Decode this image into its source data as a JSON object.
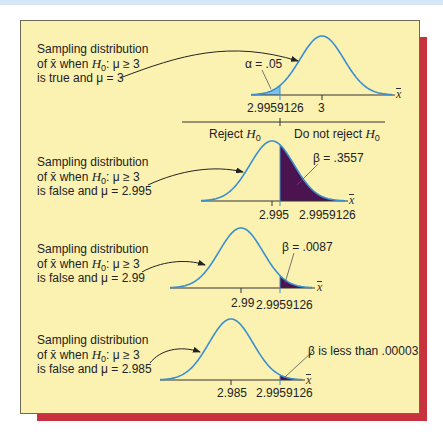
{
  "colors": {
    "panel_bg": "#fbf2b2",
    "shadow": "#c8323f",
    "curve": "#3a8fd0",
    "alpha_fill": "#7cc0ec",
    "beta_fill": "#4b1450",
    "axis": "#333333"
  },
  "critical_value": "2.9959126",
  "axis_symbol": "x̄",
  "decision": {
    "reject": "Reject",
    "do_not_reject": "Do not reject",
    "h0": "H",
    "h0_sub": "0"
  },
  "panels": [
    {
      "label_line1": "Sampling distribution",
      "label_line2_pre": "of x̄ when ",
      "label_line2_h": "H",
      "label_line2_sub": "0",
      "label_line2_post": ": μ ≥ 3",
      "label_line3": "is true and μ = 3",
      "mean_label": "3",
      "area_label": "α = .05",
      "area_type": "alpha"
    },
    {
      "label_line1": "Sampling distribution",
      "label_line2_pre": "of x̄ when ",
      "label_line2_h": "H",
      "label_line2_sub": "0",
      "label_line2_post": ": μ ≥ 3",
      "label_line3": "is false and μ = 2.995",
      "mean_label": "2.995",
      "area_label": "β = .3557",
      "area_type": "beta"
    },
    {
      "label_line1": "Sampling distribution",
      "label_line2_pre": "of x̄ when ",
      "label_line2_h": "H",
      "label_line2_sub": "0",
      "label_line2_post": ": μ ≥ 3",
      "label_line3": "is false and μ = 2.99",
      "mean_label": "2.99",
      "area_label": "β = .0087",
      "area_type": "beta"
    },
    {
      "label_line1": "Sampling distribution",
      "label_line2_pre": "of x̄ when ",
      "label_line2_h": "H",
      "label_line2_sub": "0",
      "label_line2_post": ": μ ≥ 3",
      "label_line3": "is false and μ = 2.985",
      "mean_label": "2.985",
      "area_label": "β is less than .00003",
      "area_type": "beta"
    }
  ],
  "chart_data": {
    "type": "area",
    "xlabel": "x̄",
    "critical_value": 2.9959126,
    "regions": [
      "Reject H0",
      "Do not reject H0"
    ],
    "series": [
      {
        "name": "μ = 3 (H0 true)",
        "mean": 3,
        "shaded": "left tail",
        "area_label": "α = .05",
        "area": 0.05
      },
      {
        "name": "μ = 2.995 (H0 false)",
        "mean": 2.995,
        "shaded": "right tail",
        "area_label": "β = .3557",
        "area": 0.3557
      },
      {
        "name": "μ = 2.99 (H0 false)",
        "mean": 2.99,
        "shaded": "right tail",
        "area_label": "β = .0087",
        "area": 0.0087
      },
      {
        "name": "μ = 2.985 (H0 false)",
        "mean": 2.985,
        "shaded": "right tail",
        "area_label": "β is less than .00003",
        "area": 3e-05
      }
    ]
  }
}
